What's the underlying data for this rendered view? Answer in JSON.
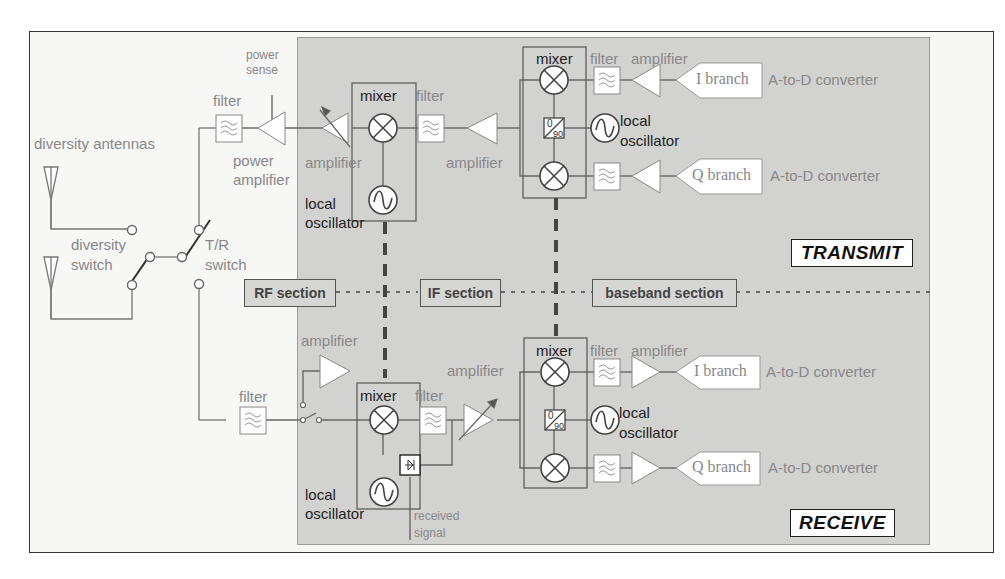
{
  "diagram": {
    "type": "radio transceiver block diagram",
    "regions": {
      "transmit_label": "TRANSMIT",
      "receive_label": "RECEIVE"
    },
    "sections": [
      {
        "id": "rf",
        "label": "RF section"
      },
      {
        "id": "if",
        "label": "IF section"
      },
      {
        "id": "baseband",
        "label": "baseband section"
      }
    ],
    "antenna": {
      "title": "diversity antennas",
      "diversity_switch": "diversity switch",
      "diversity_switch_l1": "diversity",
      "diversity_switch_l2": "switch",
      "tr_switch_l1": "T/R",
      "tr_switch_l2": "switch"
    },
    "transmit": {
      "power_sense_l1": "power",
      "power_sense_l2": "sense",
      "rf_filter": "filter",
      "power_amplifier_l1": "power",
      "power_amplifier_l2": "amplifier",
      "rf_amplifier": "amplifier",
      "if_mixer": "mixer",
      "if_lo_l1": "local",
      "if_lo_l2": "oscillator",
      "if_filter": "filter",
      "if_amplifier": "amplifier",
      "bb_mixer": "mixer",
      "bb_filter": "filter",
      "bb_amplifier": "amplifier",
      "bb_lo_l1": "local",
      "bb_lo_l2": "oscillator",
      "phase_shifter_top": "0",
      "phase_shifter_bottom": "90",
      "i_branch": "I branch",
      "q_branch": "Q branch",
      "i_converter": "A-to-D converter",
      "q_converter": "A-to-D converter"
    },
    "receive": {
      "rf_amplifier": "amplifier",
      "rf_filter": "filter",
      "if_mixer": "mixer",
      "if_filter": "filter",
      "if_lo_l1": "local",
      "if_lo_l2": "oscillator",
      "received_signal_l1": "received",
      "received_signal_l2": "signal",
      "if_amplifier": "amplifier",
      "bb_mixer": "mixer",
      "bb_filter": "filter",
      "bb_amplifier": "amplifier",
      "bb_lo_l1": "local",
      "bb_lo_l2": "oscillator",
      "phase_shifter_top": "0",
      "phase_shifter_bottom": "90",
      "i_branch": "I branch",
      "q_branch": "Q branch",
      "i_converter": "A-to-D converter",
      "q_converter": "A-to-D converter"
    },
    "colors": {
      "panel": "#d2d2d0",
      "background": "#f7f7f6",
      "line": "#555555",
      "label_gray": "#888888",
      "label_dark": "#222222"
    }
  }
}
